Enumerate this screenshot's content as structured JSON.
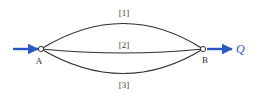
{
  "figure": {
    "type": "network-diagram",
    "background_color": "#ffffff"
  },
  "colors": {
    "pipe_stroke": "#2f2f2f",
    "flow_arrow": "#2a57c4",
    "node_outline": "#1a1a1a",
    "node_fill": "#ffffff",
    "label_text": "#3b3b3b",
    "flow_label_text": "#2a57c4"
  },
  "nodes": [
    {
      "id": "node-a",
      "label": "A",
      "x": 41,
      "y": 49,
      "label_x": 39,
      "label_y": 64,
      "radius": 2.6
    },
    {
      "id": "node-b",
      "label": "B",
      "x": 203,
      "y": 49,
      "label_x": 205,
      "label_y": 63,
      "radius": 2.6
    }
  ],
  "pipes": [
    {
      "id": "pipe-1",
      "label": "[1]",
      "label_x": 124,
      "label_y": 16,
      "path": "M 41 49 Q 124 -2 203 49"
    },
    {
      "id": "pipe-2",
      "label": "[2]",
      "label_x": 124,
      "label_y": 48,
      "path": "M 41 49 Q 124 57 203 49"
    },
    {
      "id": "pipe-3",
      "label": "[3]",
      "label_x": 124,
      "label_y": 88,
      "path": "M 41 49 Q 124 98 203 49"
    }
  ],
  "flow_arrows": [
    {
      "id": "inflow-arrow",
      "x1": 13,
      "y1": 49,
      "x2": 38,
      "y2": 49
    },
    {
      "id": "outflow-arrow",
      "x1": 207,
      "y1": 49,
      "x2": 232,
      "y2": 49
    }
  ],
  "flow_label": {
    "text": "Q",
    "x": 236,
    "y": 53
  }
}
